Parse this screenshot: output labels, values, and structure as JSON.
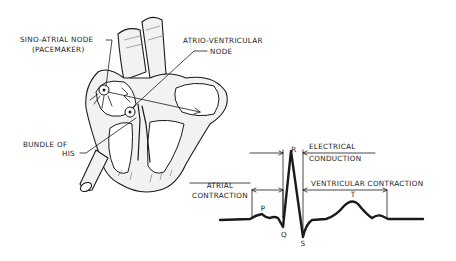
{
  "figure": {
    "type": "anatomical-diagram"
  },
  "heart_labels": {
    "sa_node_line1": "SINO-ATRIAL NODE",
    "sa_node_line2": "(PACEMAKER)",
    "av_node_line1": "ATRIO-VENTRICULAR",
    "av_node_line2": "NODE",
    "bundle_line1": "BUNDLE OF",
    "bundle_line2": "HIS"
  },
  "ecg_labels": {
    "electrical_line1": "ELECTRICAL",
    "electrical_line2": "CONDUCTION",
    "atrial_line1": "ATRIAL",
    "atrial_line2": "CONTRACTION",
    "ventricular": "VENTRICULAR CONTRACTION",
    "wave_p": "P",
    "wave_q": "Q",
    "wave_r": "R",
    "wave_s": "S",
    "wave_t": "T"
  },
  "colors": {
    "ink": "#1a1a1a",
    "background": "#ffffff"
  }
}
